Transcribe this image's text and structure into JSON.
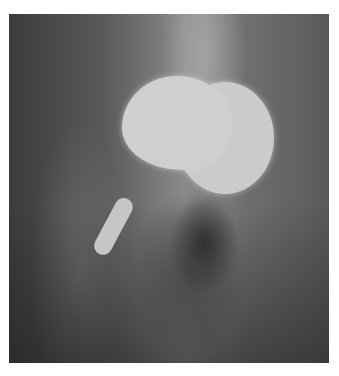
{
  "image": {
    "description": "Radiograph (X-ray) of a hip showing a metallic femoral head resurfacing implant with stem",
    "subject": "hip-xray"
  }
}
